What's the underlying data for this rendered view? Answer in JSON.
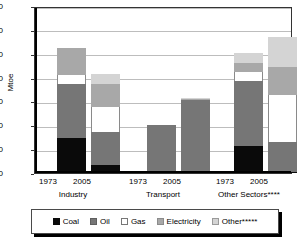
{
  "chart_data": {
    "type": "bar",
    "subtype": "stacked-bar-grouped",
    "title": "",
    "xlabel": "",
    "ylabel": "Mtoe",
    "ylim": [
      0,
      140
    ],
    "ytick_step": 20,
    "yticks": [
      0,
      20,
      40,
      60,
      80,
      100,
      120,
      140
    ],
    "grid": true,
    "legend_position": "bottom",
    "groups": [
      {
        "name": "Industry",
        "years": [
          "1973",
          "2005"
        ]
      },
      {
        "name": "Transport",
        "years": [
          "1973",
          "2005"
        ]
      },
      {
        "name": "Other Sectors****",
        "years": [
          "1973",
          "2005"
        ]
      }
    ],
    "categories": [
      "Industry 1973",
      "Industry 2005",
      "Transport 1973",
      "Transport 2005",
      "Other Sectors**** 1973",
      "Other Sectors**** 2005"
    ],
    "series": [
      {
        "name": "Coal",
        "color": "#0a0a0a",
        "values": [
          29,
          7,
          1,
          0,
          23,
          1
        ]
      },
      {
        "name": "Oil",
        "color": "#767676",
        "values": [
          46,
          27,
          39,
          61,
          54,
          25
        ]
      },
      {
        "name": "Gas",
        "color": "#ffffff",
        "values": [
          7,
          21,
          0,
          0,
          8,
          39
        ]
      },
      {
        "name": "Electricity",
        "color": "#a8a8a8",
        "values": [
          23,
          20,
          0,
          1,
          7,
          24
        ]
      },
      {
        "name": "Other*****",
        "color": "#d4d4d4",
        "values": [
          0,
          8,
          0,
          1,
          9,
          25
        ]
      }
    ],
    "totals": [
      105,
      83,
      40,
      63,
      101,
      114
    ],
    "legend_entries": [
      "Coal",
      "Oil",
      "Gas",
      "Electricity",
      "Other*****"
    ]
  },
  "axis": {
    "y_title": "Mtoe",
    "y_tick_labels": [
      "140",
      "120",
      "100",
      "80",
      "60",
      "40",
      "20",
      "0"
    ]
  },
  "legend": {
    "items": [
      {
        "label": "Coal"
      },
      {
        "label": "Oil"
      },
      {
        "label": "Gas"
      },
      {
        "label": "Electricity"
      },
      {
        "label": "Other*****"
      }
    ]
  },
  "xaxis": {
    "year_labels": [
      "1973",
      "2005",
      "1973",
      "2005",
      "1973",
      "2005"
    ],
    "group_labels": [
      "Industry",
      "Transport",
      "Other Sectors****"
    ]
  }
}
